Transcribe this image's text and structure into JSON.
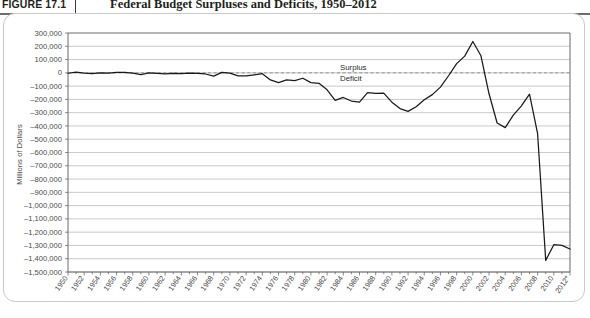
{
  "figure": {
    "number_label": "FIGURE 17.1",
    "title": "Federal Budget Surpluses and Deficits, 1950–2012"
  },
  "annotations": {
    "surplus_label": "Surplus",
    "deficit_label": "Deficit"
  },
  "chart_data": {
    "type": "line",
    "title": "Federal Budget Surpluses and Deficits, 1950–2012",
    "xlabel": "",
    "ylabel": "Millions of Dollars",
    "ylim": [
      -1500000,
      300000
    ],
    "xlim": [
      1950,
      2012
    ],
    "grid": true,
    "legend": false,
    "zero_reference_line": 0,
    "ytick_step": 100000,
    "ytick_labels": [
      "300,000",
      "200,000",
      "100,000",
      "0",
      "–100,000",
      "–200,000",
      "–300,000",
      "–400,000",
      "–500,000",
      "–600,000",
      "–700,000",
      "–800,000",
      "–900,000",
      "–1,000,000",
      "–1,100,000",
      "–1,200,000",
      "–1,300,000",
      "–1,400,000",
      "–1,500,000"
    ],
    "ytick_values": [
      300000,
      200000,
      100000,
      0,
      -100000,
      -200000,
      -300000,
      -400000,
      -500000,
      -600000,
      -700000,
      -800000,
      -900000,
      -1000000,
      -1100000,
      -1200000,
      -1300000,
      -1400000,
      -1500000
    ],
    "xtick_labels": [
      "1950",
      "1952",
      "1954",
      "1956",
      "1958",
      "1960",
      "1962",
      "1964",
      "1966",
      "1968",
      "1970",
      "1972",
      "1974",
      "1976",
      "1978",
      "1980",
      "1982",
      "1984",
      "1986",
      "1988",
      "1990",
      "1992",
      "1994",
      "1996",
      "1998",
      "2000",
      "2002",
      "2004",
      "2006",
      "2008",
      "2010",
      "2012*"
    ],
    "xtick_values": [
      1950,
      1952,
      1954,
      1956,
      1958,
      1960,
      1962,
      1964,
      1966,
      1968,
      1970,
      1972,
      1974,
      1976,
      1978,
      1980,
      1982,
      1984,
      1986,
      1988,
      1990,
      1992,
      1994,
      1996,
      1998,
      2000,
      2002,
      2004,
      2006,
      2008,
      2010,
      2012
    ],
    "series": [
      {
        "name": "Federal Budget Surplus / Deficit",
        "color": "#1a1a1a",
        "x": [
          1950,
          1951,
          1952,
          1953,
          1954,
          1955,
          1956,
          1957,
          1958,
          1959,
          1960,
          1961,
          1962,
          1963,
          1964,
          1965,
          1966,
          1967,
          1968,
          1969,
          1970,
          1971,
          1972,
          1973,
          1974,
          1975,
          1976,
          1977,
          1978,
          1979,
          1980,
          1981,
          1982,
          1983,
          1984,
          1985,
          1986,
          1987,
          1988,
          1989,
          1990,
          1991,
          1992,
          1993,
          1994,
          1995,
          1996,
          1997,
          1998,
          1999,
          2000,
          2001,
          2002,
          2003,
          2004,
          2005,
          2006,
          2007,
          2008,
          2009,
          2010,
          2011,
          2012
        ],
        "y": [
          -3119,
          6102,
          -1519,
          -6493,
          -1154,
          -2993,
          3947,
          3412,
          -2769,
          -12849,
          301,
          -3335,
          -7146,
          -4756,
          -5915,
          -1411,
          -3698,
          -8643,
          -25161,
          3242,
          -2842,
          -23033,
          -23373,
          -14908,
          -6135,
          -53242,
          -73732,
          -53659,
          -59186,
          -40726,
          -73830,
          -78968,
          -127977,
          -207802,
          -185367,
          -212308,
          -221227,
          -149730,
          -155178,
          -152639,
          -221036,
          -269238,
          -290321,
          -255051,
          -203186,
          -163952,
          -107431,
          -21884,
          69270,
          125610,
          236241,
          128236,
          -157758,
          -377585,
          -412727,
          -318346,
          -248181,
          -160701,
          -458553,
          -1412688,
          -1294373,
          -1299593,
          -1326948
        ]
      }
    ]
  }
}
